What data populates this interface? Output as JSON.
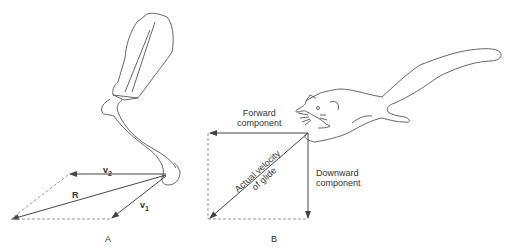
{
  "panel_a": {
    "label": "A",
    "vectors": {
      "v1": "v",
      "v1_sub": "1",
      "v2": "v",
      "v2_sub": "2",
      "resultant": "R"
    }
  },
  "panel_b": {
    "label": "B",
    "forward": [
      "Forward",
      "component"
    ],
    "downward": [
      "Downward",
      "component"
    ],
    "diagonal": [
      "Actual velocity",
      "of glide"
    ]
  },
  "colors": {
    "line": "#444444",
    "dashed": "#999999"
  }
}
